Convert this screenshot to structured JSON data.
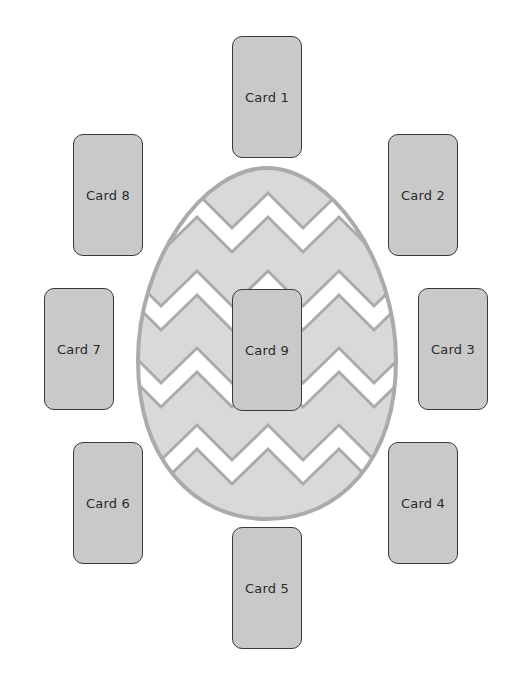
{
  "diagram": {
    "type": "tarot-spread",
    "center_shape": {
      "kind": "easter-egg",
      "pattern": "chevron-zigzag",
      "fill_color": "#d9d9d9",
      "outline_color": "#ababab",
      "stripe_color": "#ffffff"
    },
    "card_fill": "#c9c9c9",
    "card_border": "#3a3a3a",
    "cards": [
      {
        "id": 1,
        "label": "Card 1",
        "x": 232,
        "y": 36
      },
      {
        "id": 2,
        "label": "Card 2",
        "x": 388,
        "y": 134
      },
      {
        "id": 3,
        "label": "Card 3",
        "x": 418,
        "y": 288
      },
      {
        "id": 4,
        "label": "Card 4",
        "x": 388,
        "y": 442
      },
      {
        "id": 5,
        "label": "Card 5",
        "x": 232,
        "y": 527
      },
      {
        "id": 6,
        "label": "Card 6",
        "x": 73,
        "y": 442
      },
      {
        "id": 7,
        "label": "Card 7",
        "x": 44,
        "y": 288
      },
      {
        "id": 8,
        "label": "Card 8",
        "x": 73,
        "y": 134
      },
      {
        "id": 9,
        "label": "Card 9",
        "x": 232,
        "y": 289
      }
    ]
  }
}
